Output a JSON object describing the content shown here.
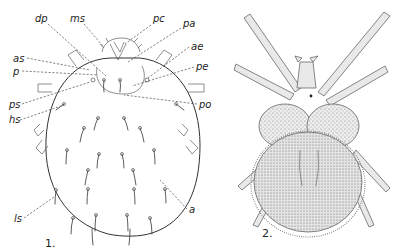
{
  "figure": {
    "type": "scientific-illustration",
    "panels": [
      {
        "number": "1.",
        "style": "line drawing with labeled setae",
        "labels": [
          {
            "text": "dp",
            "x": 35,
            "y": 22
          },
          {
            "text": "ms",
            "x": 70,
            "y": 22
          },
          {
            "text": "pc",
            "x": 153,
            "y": 22
          },
          {
            "text": "pa",
            "x": 183,
            "y": 27
          },
          {
            "text": "as",
            "x": 13,
            "y": 62
          },
          {
            "text": "ae",
            "x": 191,
            "y": 50
          },
          {
            "text": "p",
            "x": 13,
            "y": 75
          },
          {
            "text": "pe",
            "x": 196,
            "y": 70
          },
          {
            "text": "ps",
            "x": 9,
            "y": 108
          },
          {
            "text": "po",
            "x": 199,
            "y": 108
          },
          {
            "text": "hs",
            "x": 9,
            "y": 123
          },
          {
            "text": "a",
            "x": 189,
            "y": 213
          },
          {
            "text": "ls",
            "x": 14,
            "y": 222
          }
        ]
      },
      {
        "number": "2.",
        "style": "stippled drawing"
      }
    ]
  }
}
